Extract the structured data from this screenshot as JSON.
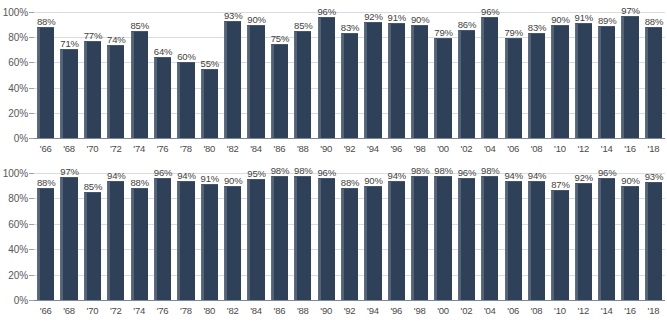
{
  "axis": {
    "y_ticks": [
      "100%",
      "80%",
      "60%",
      "40%",
      "20%",
      "0%"
    ],
    "y_values": [
      100,
      80,
      60,
      40,
      20,
      0
    ]
  },
  "colors": {
    "bar_fill": "#2f4158",
    "bar_highlight": "#5b6e86",
    "gridline": "#d9dde2",
    "baseline": "#7b8794",
    "label_text": "#3f3f41",
    "axis_text": "#58585a",
    "background": "#ffffff"
  },
  "chart_data": [
    {
      "type": "bar",
      "title": "",
      "subtitle": "",
      "xlabel": "",
      "ylabel": "",
      "ylim": [
        0,
        100
      ],
      "grid": true,
      "legend": null,
      "categories": [
        "'66",
        "'68",
        "'70",
        "'72",
        "'74",
        "'76",
        "'78",
        "'80",
        "'82",
        "'84",
        "'86",
        "'88",
        "'90",
        "'92",
        "'94",
        "'96",
        "'98",
        "'00",
        "'02",
        "'04",
        "'06",
        "'08",
        "'10",
        "'12",
        "'14",
        "'16",
        "'18"
      ],
      "values": [
        88,
        71,
        77,
        74,
        85,
        64,
        60,
        55,
        93,
        90,
        75,
        85,
        96,
        83,
        92,
        91,
        90,
        79,
        86,
        96,
        79,
        83,
        90,
        91,
        89,
        97,
        88
      ],
      "data_labels": [
        "88%",
        "71%",
        "77%",
        "74%",
        "85%",
        "64%",
        "60%",
        "55%",
        "93%",
        "90%",
        "75%",
        "85%",
        "96%",
        "83%",
        "92%",
        "91%",
        "90%",
        "79%",
        "86%",
        "96%",
        "79%",
        "83%",
        "90%",
        "91%",
        "89%",
        "97%",
        "88%"
      ]
    },
    {
      "type": "bar",
      "title": "",
      "subtitle": "",
      "xlabel": "",
      "ylabel": "",
      "ylim": [
        0,
        100
      ],
      "grid": true,
      "legend": null,
      "categories": [
        "'66",
        "'68",
        "'70",
        "'72",
        "'74",
        "'76",
        "'78",
        "'80",
        "'82",
        "'84",
        "'86",
        "'88",
        "'90",
        "'92",
        "'94",
        "'96",
        "'98",
        "'00",
        "'02",
        "'04",
        "'06",
        "'08",
        "'10",
        "'12",
        "'14",
        "'16",
        "'18"
      ],
      "values": [
        88,
        97,
        85,
        94,
        88,
        96,
        94,
        91,
        90,
        95,
        98,
        98,
        96,
        88,
        90,
        94,
        98,
        98,
        96,
        98,
        94,
        94,
        87,
        92,
        96,
        90,
        93
      ],
      "data_labels": [
        "88%",
        "97%",
        "85%",
        "94%",
        "88%",
        "96%",
        "94%",
        "91%",
        "90%",
        "95%",
        "98%",
        "98%",
        "96%",
        "88%",
        "90%",
        "94%",
        "98%",
        "98%",
        "96%",
        "98%",
        "94%",
        "94%",
        "87%",
        "92%",
        "96%",
        "90%",
        "93%"
      ]
    }
  ]
}
